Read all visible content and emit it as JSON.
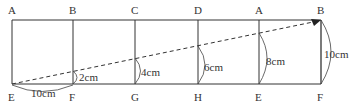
{
  "diagram": {
    "top_labels": [
      "A",
      "B",
      "C",
      "D",
      "A",
      "B"
    ],
    "bottom_labels": [
      "E",
      "F",
      "G",
      "H",
      "E",
      "F"
    ],
    "measurements": {
      "base": "10cm",
      "bf": "2cm",
      "cg": "4cm",
      "dh": "6cm",
      "ae": "8cm",
      "bf_full": "10cm"
    },
    "colors": {
      "line": "#333333",
      "dashed": "#333333",
      "background": "#ffffff"
    }
  }
}
